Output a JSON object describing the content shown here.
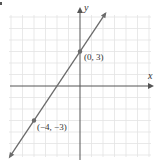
{
  "chart_data": {
    "type": "line",
    "title": "",
    "xlabel": "x",
    "ylabel": "y",
    "xlim": [
      -6,
      6
    ],
    "ylim": [
      -6,
      6
    ],
    "grid": true,
    "grid_step": 1,
    "series": [
      {
        "name": "line through (-4, -3) and (0, 3)",
        "equation": "y = 1.5x + 3",
        "slope": 1.5,
        "intercept": 3,
        "x": [
          -6.1,
          2.2
        ],
        "y": [
          -6.15,
          6.3
        ],
        "arrows": "both"
      }
    ],
    "points": [
      {
        "x": 0,
        "y": 3,
        "label": "(0, 3)"
      },
      {
        "x": -4,
        "y": -3,
        "label": "(−4, −3)"
      }
    ]
  },
  "labels": {
    "x_axis": "x",
    "y_axis": "y",
    "point_a": "(0, 3)",
    "point_b": "(−4, −3)"
  },
  "colors": {
    "grid": "#e3e3e3",
    "axis": "#555555",
    "line": "#6b6b6b",
    "point": "#6b6b6b",
    "text": "#333333"
  }
}
